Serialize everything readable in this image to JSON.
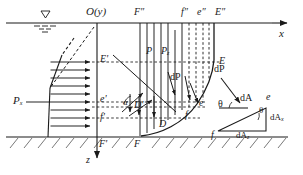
{
  "figure": {
    "kind": "hydrostatic-pressure-on-curved-surface-diagram",
    "axes": {
      "origin_label": "O(y)",
      "x_axis_label": "x",
      "z_axis_label": "z"
    },
    "symbols": {
      "water_surface": "free-water-surface-symbol",
      "ground_hatching": "hatched-ground-line"
    },
    "left_pressure_block": {
      "resultant_label": "P",
      "resultant_subscript": "x",
      "arrow_count": 8,
      "projection_points": [
        "E'",
        "e'",
        "f'",
        "F'"
      ]
    },
    "top_projection_points": [
      "F″",
      "f″",
      "e″",
      "E″"
    ],
    "curve_points": [
      "E",
      "e",
      "f",
      "D",
      "F"
    ],
    "interior_labels": {
      "vertical_pressure": "P",
      "vertical_pressure_sub": "z",
      "element_force": "dP",
      "angle": "α",
      "point_d_prime": "D'",
      "point_d": "D"
    },
    "inset": {
      "title": "elemental-area-force-triangle",
      "force_label": "dP",
      "area_label": "dA",
      "angle_label_left": "θ",
      "angle_label_right": "θ",
      "area_x_label": "dA",
      "area_x_sub": "x",
      "area_z_label": "dA",
      "area_z_sub": "z",
      "vertex_upper": "e",
      "vertex_lower": "f"
    },
    "colors": {
      "line": "#1a1a1a",
      "dashed": "#2a2a2a",
      "background": "#ffffff"
    }
  }
}
